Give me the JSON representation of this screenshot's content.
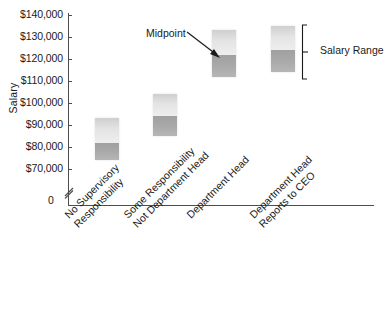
{
  "chart_data": {
    "type": "bar",
    "title": "",
    "xlabel": "",
    "ylabel": "Salary",
    "ylim": [
      70000,
      140000
    ],
    "grid": false,
    "legend_position": "right",
    "axis_break": true,
    "axis_origin_label": "0",
    "y_tick_labels": [
      "$140,000",
      "$130,000",
      "$120,000",
      "$110,000",
      "$100,000",
      "$90,000",
      "$80,000",
      "$70,000"
    ],
    "y_tick_values": [
      140000,
      130000,
      120000,
      110000,
      100000,
      90000,
      80000,
      70000
    ],
    "categories": [
      "No Supervisory Responsibility",
      "Some Responsibility Not Department Head",
      "Department Head",
      "Department Head Reports to CEO"
    ],
    "category_lines": [
      [
        "No Supervisory",
        "Responsibility"
      ],
      [
        "Some Responsibility",
        "Not Department Head"
      ],
      [
        "Department Head"
      ],
      [
        "Department Head",
        "Reports to CEO"
      ]
    ],
    "series": [
      {
        "name": "Salary Range",
        "ranges": [
          {
            "min": 74000,
            "midpoint": 82000,
            "max": 93000
          },
          {
            "min": 85000,
            "midpoint": 94000,
            "max": 104000
          },
          {
            "min": 112000,
            "midpoint": 122000,
            "max": 133000
          },
          {
            "min": 114000,
            "midpoint": 124000,
            "max": 135000
          }
        ]
      }
    ],
    "annotations": [
      {
        "name": "midpoint",
        "text": "Midpoint",
        "points_to_category": "Department Head"
      },
      {
        "name": "salary-range",
        "text": "Salary Range",
        "points_to_category": "Department Head Reports to CEO"
      }
    ],
    "colors": {
      "upper_band": "#e4e4e4",
      "lower_band": "#a9a9a9",
      "axis": "#4d4d4d",
      "text": "#1a1a1a"
    }
  }
}
